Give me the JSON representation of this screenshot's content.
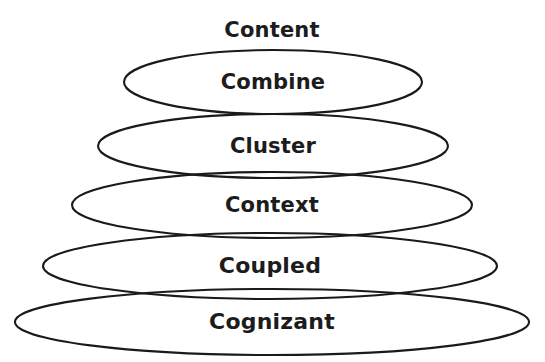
{
  "diagram": {
    "title": "Content",
    "title_position": {
      "cx": 272,
      "cy": 30
    },
    "title_font_size": 21,
    "background_color": "#ffffff",
    "stroke_color": "#1a1a1a",
    "text_color": "#1c1c1c",
    "layers": [
      {
        "label": "Cognizant",
        "level": 1,
        "cx": 272,
        "cy": 322,
        "rx": 257,
        "ry": 33,
        "font_size": 22
      },
      {
        "label": "Coupled",
        "level": 2,
        "cx": 270,
        "cy": 266,
        "rx": 227,
        "ry": 33,
        "font_size": 22
      },
      {
        "label": "Context",
        "level": 3,
        "cx": 272,
        "cy": 205,
        "rx": 200,
        "ry": 33,
        "font_size": 21
      },
      {
        "label": "Cluster",
        "level": 4,
        "cx": 273,
        "cy": 146,
        "rx": 175,
        "ry": 32,
        "font_size": 21
      },
      {
        "label": "Combine",
        "level": 5,
        "cx": 273,
        "cy": 82,
        "rx": 149,
        "ry": 32,
        "font_size": 21
      }
    ]
  }
}
